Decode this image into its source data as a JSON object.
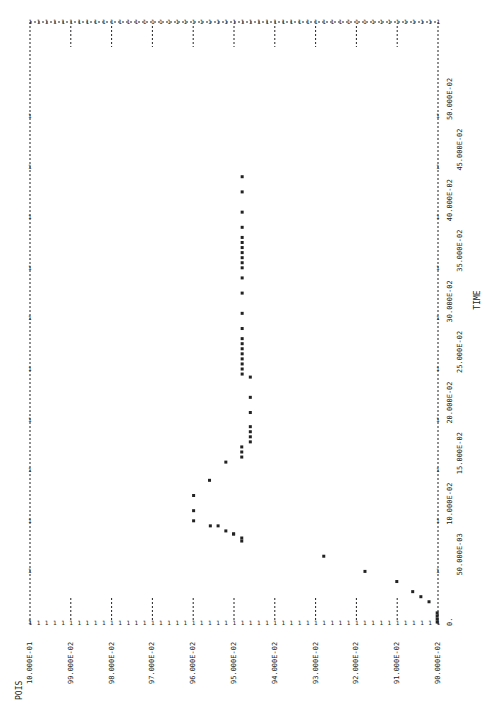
{
  "chart_data": {
    "type": "scatter",
    "title": "",
    "orientation": "rotated 90deg (POIS values along bottom edge, TIME along right edge)",
    "xlabel": "TIME",
    "ylabel": "POIS",
    "time_ticks": [
      "0.",
      "50.000E-03",
      "10.000E-02",
      "15.000E-02",
      "20.000E-02",
      "25.000E-02",
      "30.000E-02",
      "35.000E-02",
      "40.000E-02",
      "45.000E-02",
      "50.000E-02"
    ],
    "pois_ticks": [
      "10.000E-01",
      "99.000E-02",
      "98.000E-02",
      "97.000E-02",
      "96.000E-02",
      "95.000E-02",
      "94.000E-02",
      "93.000E-02",
      "92.000E-02",
      "91.000E-02",
      "90.000E-02"
    ],
    "time_range": [
      0,
      0.5
    ],
    "pois_range": [
      0.9,
      1.0
    ],
    "grid": false,
    "series": [
      {
        "name": "POIS",
        "points": [
          {
            "time": 0.0,
            "pois": 0.9002
          },
          {
            "time": 0.003,
            "pois": 0.9002
          },
          {
            "time": 0.006,
            "pois": 0.9002
          },
          {
            "time": 0.009,
            "pois": 0.9002
          },
          {
            "time": 0.02,
            "pois": 0.9022
          },
          {
            "time": 0.025,
            "pois": 0.9042
          },
          {
            "time": 0.03,
            "pois": 0.9062
          },
          {
            "time": 0.04,
            "pois": 0.9101
          },
          {
            "time": 0.05,
            "pois": 0.9179
          },
          {
            "time": 0.065,
            "pois": 0.928
          },
          {
            "time": 0.08,
            "pois": 0.9481
          },
          {
            "time": 0.083,
            "pois": 0.9481
          },
          {
            "time": 0.087,
            "pois": 0.9501
          },
          {
            "time": 0.087,
            "pois": 0.9501
          },
          {
            "time": 0.09,
            "pois": 0.952
          },
          {
            "time": 0.095,
            "pois": 0.9539
          },
          {
            "time": 0.095,
            "pois": 0.9558
          },
          {
            "time": 0.1,
            "pois": 0.9599
          },
          {
            "time": 0.11,
            "pois": 0.9599
          },
          {
            "time": 0.125,
            "pois": 0.9599
          },
          {
            "time": 0.14,
            "pois": 0.956
          },
          {
            "time": 0.158,
            "pois": 0.952
          },
          {
            "time": 0.163,
            "pois": 0.9481
          },
          {
            "time": 0.168,
            "pois": 0.9481
          },
          {
            "time": 0.173,
            "pois": 0.9481
          },
          {
            "time": 0.178,
            "pois": 0.946
          },
          {
            "time": 0.183,
            "pois": 0.946
          },
          {
            "time": 0.188,
            "pois": 0.946
          },
          {
            "time": 0.193,
            "pois": 0.946
          },
          {
            "time": 0.207,
            "pois": 0.946
          },
          {
            "time": 0.222,
            "pois": 0.946
          },
          {
            "time": 0.242,
            "pois": 0.946
          },
          {
            "time": 0.245,
            "pois": 0.948
          },
          {
            "time": 0.25,
            "pois": 0.948
          },
          {
            "time": 0.255,
            "pois": 0.948
          },
          {
            "time": 0.26,
            "pois": 0.948
          },
          {
            "time": 0.265,
            "pois": 0.948
          },
          {
            "time": 0.27,
            "pois": 0.948
          },
          {
            "time": 0.275,
            "pois": 0.948
          },
          {
            "time": 0.28,
            "pois": 0.948
          },
          {
            "time": 0.29,
            "pois": 0.948
          },
          {
            "time": 0.305,
            "pois": 0.948
          },
          {
            "time": 0.325,
            "pois": 0.948
          },
          {
            "time": 0.34,
            "pois": 0.948
          },
          {
            "time": 0.35,
            "pois": 0.948
          },
          {
            "time": 0.355,
            "pois": 0.948
          },
          {
            "time": 0.36,
            "pois": 0.948
          },
          {
            "time": 0.365,
            "pois": 0.948
          },
          {
            "time": 0.37,
            "pois": 0.948
          },
          {
            "time": 0.375,
            "pois": 0.948
          },
          {
            "time": 0.38,
            "pois": 0.948
          },
          {
            "time": 0.39,
            "pois": 0.948
          },
          {
            "time": 0.405,
            "pois": 0.948
          },
          {
            "time": 0.425,
            "pois": 0.948
          },
          {
            "time": 0.44,
            "pois": 0.948
          }
        ]
      }
    ]
  },
  "labels": {
    "pois_title": "POIS",
    "time_title": "TIME"
  },
  "style": {
    "ink": "#222222",
    "background": "#ffffff"
  }
}
